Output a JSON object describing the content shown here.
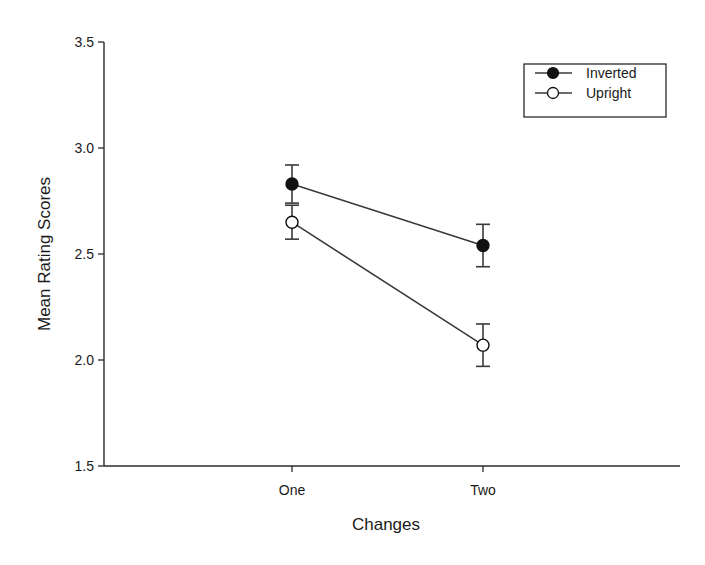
{
  "chart_data": {
    "type": "line",
    "title": "",
    "xlabel": "Changes",
    "ylabel": "Mean Rating Scores",
    "categories": [
      "One",
      "Two"
    ],
    "ylim": [
      1.5,
      3.5
    ],
    "yticks": [
      "1.5",
      "2.0",
      "2.5",
      "3.0",
      "3.5"
    ],
    "grid": false,
    "legend_position": "upper right",
    "series": [
      {
        "name": "Inverted",
        "marker": "filled-circle",
        "values": [
          2.83,
          2.54
        ],
        "error": [
          0.09,
          0.1
        ]
      },
      {
        "name": "Upright",
        "marker": "open-circle",
        "values": [
          2.65,
          2.07
        ],
        "error": [
          0.08,
          0.1
        ]
      }
    ]
  },
  "legend": {
    "items": [
      "Inverted",
      "Upright"
    ]
  },
  "axis": {
    "x_label": "Changes",
    "y_label": "Mean Rating Scores"
  },
  "colors": {
    "line": "#3a3a3a",
    "axis": "#2a2a2a",
    "marker_fill": "#111111",
    "background": "#ffffff"
  }
}
